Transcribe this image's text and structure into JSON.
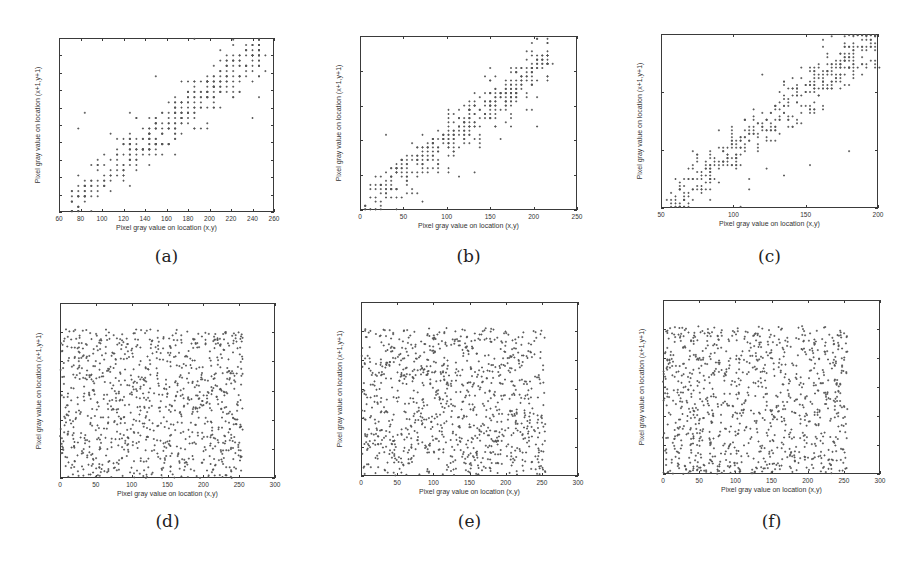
{
  "chart_data": [
    {
      "id": "a",
      "type": "scatter",
      "caption": "(a)",
      "title": "",
      "xlabel": "Pixel gray value on location (x,y)",
      "ylabel": "Pixel gray value on location (x+1,y+1)",
      "xlim": [
        60,
        260
      ],
      "ylim": [
        60,
        260
      ],
      "xticks": [
        60,
        80,
        100,
        120,
        140,
        160,
        180,
        200,
        220,
        240,
        260
      ],
      "yticks": [
        60,
        80,
        100,
        120,
        140,
        160,
        180,
        200,
        220,
        240,
        260
      ],
      "grid": false,
      "distribution": "correlated",
      "correlation": "strong positive (y ≈ x)",
      "x_range": [
        65,
        250
      ],
      "spread": 14,
      "n_points": 420,
      "seed": 11,
      "quantize": 6,
      "box": {
        "left": 59,
        "top": 38,
        "width": 215,
        "height": 174
      }
    },
    {
      "id": "b",
      "type": "scatter",
      "caption": "(b)",
      "title": "",
      "xlabel": "Pixel gray value on location (x,y)",
      "ylabel": "Pixel gray value on location (x+1,y+1)",
      "xlim": [
        0,
        250
      ],
      "ylim": [
        0,
        250
      ],
      "xticks": [
        0,
        50,
        100,
        150,
        200,
        250
      ],
      "yticks": [
        0,
        50,
        100,
        150,
        200,
        250
      ],
      "grid": false,
      "distribution": "correlated",
      "correlation": "strong positive (y ≈ x)",
      "x_range": [
        3,
        220
      ],
      "spread": 16,
      "n_points": 430,
      "seed": 23,
      "quantize": 6,
      "box": {
        "left": 360,
        "top": 36,
        "width": 217,
        "height": 174
      }
    },
    {
      "id": "c",
      "type": "scatter",
      "caption": "(c)",
      "title": "",
      "xlabel": "Pixel gray value on location (x,y)",
      "ylabel": "Pixel gray value on location (x+1,y+1)",
      "xlim": [
        50,
        200
      ],
      "ylim": [
        50,
        200
      ],
      "xticks": [
        50,
        100,
        150,
        200
      ],
      "yticks": [
        50,
        100,
        150,
        200
      ],
      "grid": false,
      "distribution": "correlated",
      "correlation": "strong positive (y ≈ x)",
      "x_range": [
        54,
        200
      ],
      "spread": 11,
      "n_points": 430,
      "seed": 37,
      "quantize": 3,
      "box": {
        "left": 661,
        "top": 34,
        "width": 217,
        "height": 174
      }
    },
    {
      "id": "d",
      "type": "scatter",
      "caption": "(d)",
      "title": "",
      "xlabel": "Pixel gray value on location (x,y)",
      "ylabel": "Pixel gray value on location (x+1,y+1)",
      "xlim": [
        0,
        300
      ],
      "ylim": [
        0,
        300
      ],
      "xticks": [
        0,
        50,
        100,
        150,
        200,
        250,
        300
      ],
      "yticks": [
        0,
        50,
        100,
        150,
        200,
        250,
        300
      ],
      "grid": false,
      "distribution": "uniform",
      "correlation": "none (uniform over 0–255)",
      "x_range": [
        0,
        255
      ],
      "y_range": [
        0,
        255
      ],
      "n_points": 1000,
      "seed": 41,
      "box": {
        "left": 60,
        "top": 303,
        "width": 215,
        "height": 175
      }
    },
    {
      "id": "e",
      "type": "scatter",
      "caption": "(e)",
      "title": "",
      "xlabel": "Pixel gray value on location (x,y)",
      "ylabel": "Pixel gray value on location (x+1,y+1)",
      "xlim": [
        0,
        300
      ],
      "ylim": [
        0,
        300
      ],
      "xticks": [
        0,
        50,
        100,
        150,
        200,
        250,
        300
      ],
      "yticks": [
        0,
        50,
        100,
        150,
        200,
        250,
        300
      ],
      "grid": false,
      "distribution": "uniform",
      "correlation": "none (uniform over 0–255)",
      "x_range": [
        0,
        255
      ],
      "y_range": [
        0,
        255
      ],
      "n_points": 1000,
      "seed": 53,
      "box": {
        "left": 361,
        "top": 302,
        "width": 217,
        "height": 174
      }
    },
    {
      "id": "f",
      "type": "scatter",
      "caption": "(f)",
      "title": "",
      "xlabel": "Pixel gray value on location (x,y)",
      "ylabel": "Pixel gray value on location (x+1,y+1)",
      "xlim": [
        0,
        300
      ],
      "ylim": [
        0,
        300
      ],
      "xticks": [
        0,
        50,
        100,
        150,
        200,
        250,
        300
      ],
      "yticks": [
        0,
        50,
        100,
        150,
        200,
        250,
        300
      ],
      "grid": false,
      "distribution": "uniform",
      "correlation": "none (uniform over 0–255)",
      "x_range": [
        0,
        255
      ],
      "y_range": [
        0,
        255
      ],
      "n_points": 1000,
      "seed": 67,
      "box": {
        "left": 663,
        "top": 300,
        "width": 217,
        "height": 174
      }
    }
  ],
  "colors": {
    "marker": "#555555",
    "axes": "#3a3a3a",
    "text": "#333333",
    "background": "#ffffff"
  },
  "captions_y": {
    "top_row": 246,
    "bottom_row": 511
  }
}
